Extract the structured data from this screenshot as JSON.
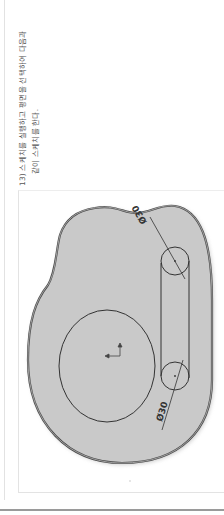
{
  "instruction": {
    "step_number": "13)",
    "line1": "스케치를 실행하고 평면을 선택하여 다음과",
    "line2": "같이 스케치를 한다."
  },
  "sketch": {
    "dimension_top_label": "Ø30",
    "dimension_bottom_label": "Ø30",
    "fill_color": "#c9c9c9",
    "outline_color": "#4a4a4a",
    "line_color": "#333333"
  }
}
